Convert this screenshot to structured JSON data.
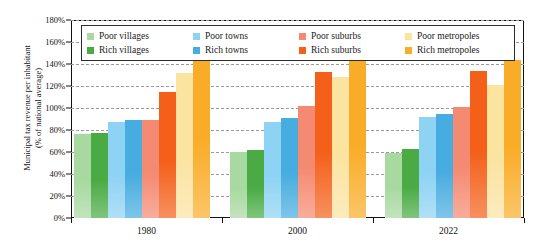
{
  "chart_data": {
    "type": "bar",
    "title": "",
    "xlabel": "",
    "ylabel": "Municipal tax revenue per inhabitant\n(% of national average)",
    "categories": [
      "1980",
      "2000",
      "2022"
    ],
    "ylim": [
      0,
      180
    ],
    "ytick_labels": [
      "0%",
      "20%",
      "40%",
      "60%",
      "80%",
      "100%",
      "120%",
      "140%",
      "160%",
      "180%"
    ],
    "ytick_values": [
      0,
      20,
      40,
      60,
      80,
      100,
      120,
      140,
      160,
      180
    ],
    "grid": "horizontal-dashed",
    "legend_position": "top-inside",
    "series": [
      {
        "name": "Poor villages",
        "color": "#a8d9a0",
        "values": [
          76,
          60,
          59
        ]
      },
      {
        "name": "Rich villages",
        "color": "#4aab45",
        "values": [
          77,
          62,
          63
        ]
      },
      {
        "name": "Poor towns",
        "color": "#8ed2f4",
        "values": [
          87,
          87,
          92
        ]
      },
      {
        "name": "Rich towns",
        "color": "#47acdf",
        "values": [
          89,
          91,
          95
        ]
      },
      {
        "name": "Poor suburbs",
        "color": "#f58a72",
        "values": [
          89,
          102,
          101
        ]
      },
      {
        "name": "Rich suburbs",
        "color": "#f4601a",
        "values": [
          115,
          133,
          134
        ]
      },
      {
        "name": "Poor metropoles",
        "color": "#fbe3a0",
        "values": [
          132,
          128,
          121
        ]
      },
      {
        "name": "Rich metropoles",
        "color": "#f9ac27",
        "values": [
          157,
          146,
          144
        ]
      }
    ]
  }
}
